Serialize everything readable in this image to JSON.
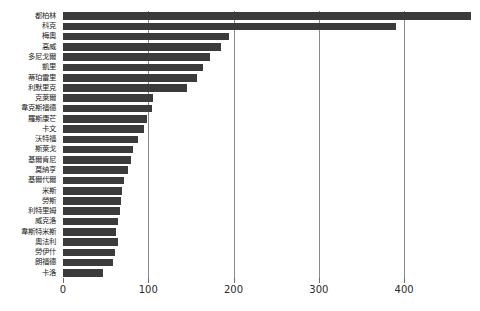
{
  "chart_data": {
    "type": "bar",
    "orientation": "horizontal",
    "title": "",
    "subtitle": "",
    "xlabel": "",
    "ylabel": "",
    "xlim": [
      0,
      489
    ],
    "xticks": [
      0,
      100,
      200,
      300,
      400
    ],
    "xtick_labels": [
      "0",
      "100",
      "200",
      "300",
      "400"
    ],
    "grid": true,
    "grid_axis": "x",
    "legend": false,
    "legend_position": "none",
    "bar_color": "#3b3b3b",
    "background_color": "#ffffff",
    "gridline_color": "#8a8a8a",
    "categories": [
      "都柏林",
      "科克",
      "梅奧",
      "高威",
      "多尼戈爾",
      "凱里",
      "蒂珀雷里",
      "利默里克",
      "克萊爾",
      "韋克斯福德",
      "羅斯康芒",
      "卡文",
      "沃特福",
      "斯萊戈",
      "基爾肯尼",
      "莫納亨",
      "基爾代爾",
      "米斯",
      "勞斯",
      "利特里姆",
      "威克洛",
      "韋斯特米斯",
      "奧法利",
      "勞伊什",
      "朗福德",
      "卡洛"
    ],
    "values": [
      478,
      391,
      195,
      185,
      172,
      164,
      157,
      145,
      106,
      104,
      99,
      95,
      88,
      82,
      80,
      76,
      72,
      69,
      68,
      67,
      64,
      62,
      65,
      61,
      59,
      47
    ]
  }
}
